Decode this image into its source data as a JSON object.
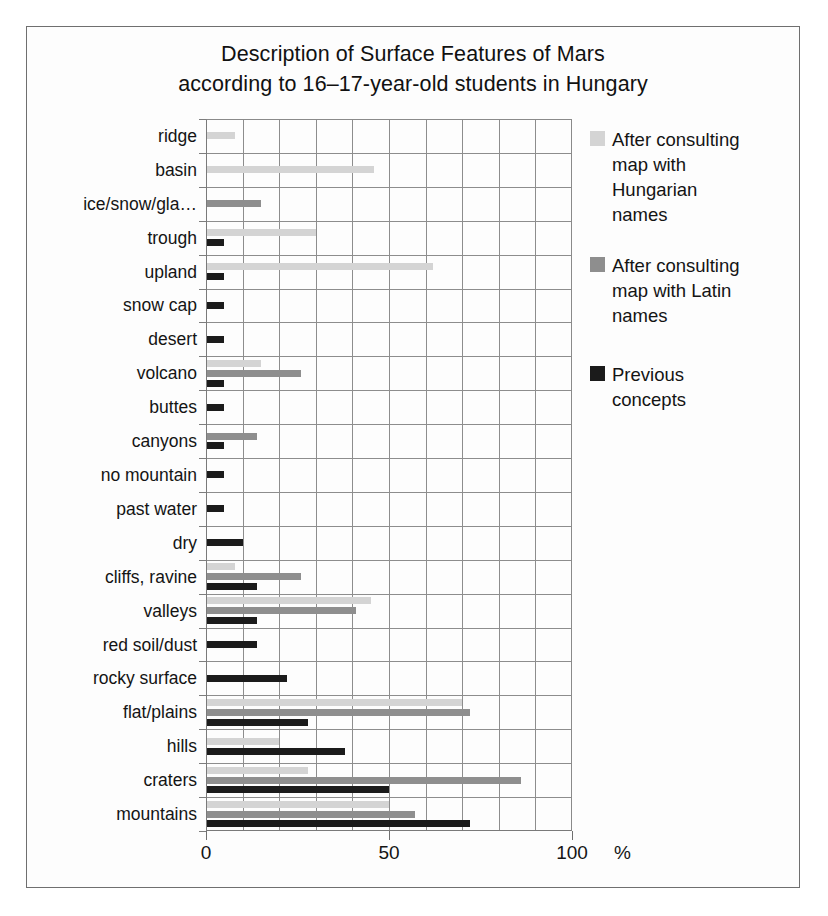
{
  "chart_data": {
    "type": "bar",
    "orientation": "horizontal",
    "title": "Description of Surface Features of Mars according to 16–17-year-old students  in Hungary",
    "title_lines": [
      "Description of Surface Features of Mars",
      "according to 16–17-year-old students  in Hungary"
    ],
    "xlabel": "%",
    "ylabel": "",
    "xlim": [
      0,
      100
    ],
    "xticks": [
      0,
      50,
      100
    ],
    "xtick_labels": [
      "0",
      "50",
      "100"
    ],
    "grid": "vertical-every-10-and-horizontal-per-category",
    "legend_position": "right",
    "categories": [
      "ridge",
      "basin",
      "ice/snow/gla…",
      "trough",
      "upland",
      "snow cap",
      "desert",
      "volcano",
      "buttes",
      "canyons",
      "no mountain",
      "past water",
      "dry",
      "cliffs, ravine",
      "valleys",
      "red soil/dust",
      "rocky surface",
      "flat/plains",
      "hills",
      "craters",
      "mountains"
    ],
    "series": [
      {
        "name": "After consulting map with Hungarian names",
        "name_lines": [
          "After consulting",
          "map with",
          "Hungarian",
          "names"
        ],
        "color": "#d4d4d4",
        "values": [
          8,
          46,
          0,
          30,
          62,
          0,
          0,
          15,
          0,
          0,
          0,
          0,
          0,
          8,
          45,
          0,
          0,
          70,
          20,
          28,
          50
        ]
      },
      {
        "name": "After consulting map with Latin names",
        "name_lines": [
          "After consulting",
          "map with Latin",
          "names"
        ],
        "color": "#8e8e8e",
        "values": [
          0,
          0,
          15,
          0,
          0,
          0,
          0,
          26,
          0,
          14,
          0,
          0,
          0,
          26,
          41,
          0,
          0,
          72,
          0,
          86,
          57
        ]
      },
      {
        "name": "Previous concepts",
        "name_lines": [
          "Previous",
          "concepts"
        ],
        "color": "#1b1b1b",
        "values": [
          0,
          0,
          0,
          5,
          5,
          5,
          5,
          5,
          5,
          5,
          5,
          5,
          10,
          14,
          14,
          14,
          22,
          28,
          38,
          50,
          72
        ]
      }
    ]
  }
}
